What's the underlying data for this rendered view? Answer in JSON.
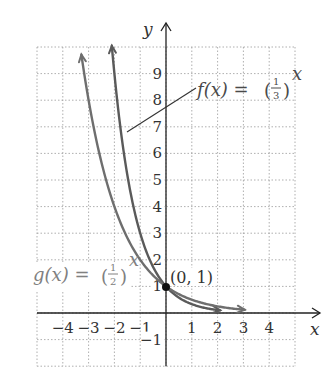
{
  "chart_data": {
    "type": "line",
    "title": "",
    "xlabel": "x",
    "ylabel": "y",
    "xlim": [
      -5,
      5
    ],
    "ylim": [
      -2,
      10
    ],
    "grid": true,
    "grid_style": "dotted",
    "x_ticks": [
      -4,
      -3,
      -2,
      -1,
      1,
      2,
      3,
      4
    ],
    "x_tick_labels": [
      "−4",
      "−3",
      "−2",
      "−1",
      "1",
      "2",
      "3",
      "4"
    ],
    "y_ticks": [
      -1,
      1,
      2,
      3,
      4,
      5,
      6,
      7,
      8,
      9
    ],
    "y_tick_labels": [
      "−1",
      "1",
      "2",
      "3",
      "4",
      "5",
      "6",
      "7",
      "8",
      "9"
    ],
    "series": [
      {
        "name": "f(x) = (1/3)^x",
        "base_num": "1",
        "base_den": "3",
        "x_range": [
          -2.1,
          2.1
        ],
        "color": "#5a5a5a",
        "label_color": "#4a4a4a",
        "x": [
          -2,
          -1,
          0,
          1,
          2
        ],
        "values": [
          9,
          3,
          1,
          0.333,
          0.111
        ]
      },
      {
        "name": "g(x) = (1/2)^x",
        "base_num": "1",
        "base_den": "2",
        "x_range": [
          -3.28,
          3.05
        ],
        "color": "#6e6e6e",
        "label_color": "#808080",
        "x": [
          -3,
          -2,
          -1,
          0,
          1,
          2,
          3
        ],
        "values": [
          8,
          4,
          2,
          1,
          0.5,
          0.25,
          0.125
        ]
      }
    ],
    "annotations": [
      {
        "text": "(0, 1)",
        "x": 0,
        "y": 1,
        "marker": "filled-circle"
      }
    ]
  },
  "labels": {
    "f_prefix": "f(x) = ",
    "g_prefix": "g(x) = ",
    "exponent": "x",
    "point": "(0, 1)",
    "x_axis": "x",
    "y_axis": "y"
  }
}
